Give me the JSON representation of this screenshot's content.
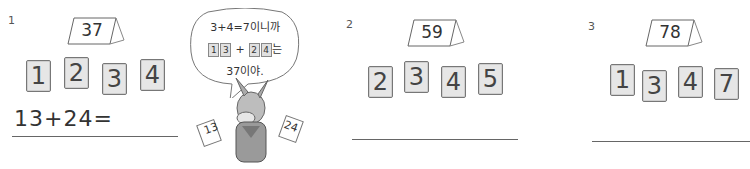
{
  "problems": [
    {
      "number": "1",
      "target": "37",
      "cards": [
        "1",
        "2",
        "3",
        "4"
      ],
      "answer": "13+24="
    },
    {
      "number": "2",
      "target": "59",
      "cards": [
        "2",
        "3",
        "4",
        "5"
      ],
      "answer": ""
    },
    {
      "number": "3",
      "target": "78",
      "cards": [
        "1",
        "3",
        "4",
        "7"
      ],
      "answer": ""
    }
  ],
  "bubble": {
    "line1": "3+4=7이니까",
    "cards_a": [
      "1",
      "3"
    ],
    "plus": "+",
    "cards_b": [
      "2",
      "4"
    ],
    "suffix": "는",
    "line3": "37이야."
  },
  "donkey_cards": {
    "left": "13",
    "right": "24"
  }
}
